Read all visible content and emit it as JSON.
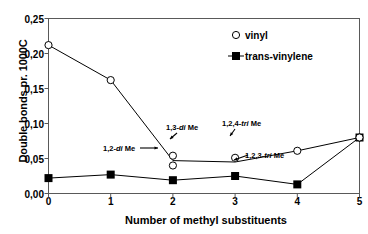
{
  "chart_data": {
    "type": "line",
    "title": "",
    "xlabel": "Number of methyl substituents",
    "ylabel": "Double bonds pr. 1000C",
    "xlim": [
      0,
      5
    ],
    "ylim": [
      0.0,
      0.25
    ],
    "grid": false,
    "legend_position": "top-right",
    "x_ticks": [
      "0",
      "1",
      "2",
      "3",
      "4",
      "5"
    ],
    "y_ticks": [
      "0,00",
      "0,05",
      "0,10",
      "0,15",
      "0,20",
      "0,25"
    ],
    "decimal_separator": ",",
    "series": [
      {
        "name": "vinyl",
        "marker": "open-circle",
        "x": [
          0,
          1,
          2,
          2,
          3,
          4,
          5
        ],
        "values": [
          0.212,
          0.162,
          0.054,
          0.04,
          0.051,
          0.061,
          0.08
        ],
        "line_x": [
          0,
          1,
          2,
          3,
          4,
          5
        ],
        "line_values": [
          0.212,
          0.162,
          0.047,
          0.045,
          0.061,
          0.08
        ]
      },
      {
        "name": "trans-vinylene",
        "marker": "filled-square",
        "x": [
          0,
          1,
          2,
          3,
          4,
          5
        ],
        "values": [
          0.022,
          0.027,
          0.019,
          0.025,
          0.013,
          0.08
        ]
      }
    ],
    "annotations": [
      {
        "id": "a13dime",
        "label_pre": "1,3-",
        "label_it": "di",
        "label_post": " Me",
        "x": 2,
        "y": 0.054
      },
      {
        "id": "a12dime",
        "label_pre": "1,2-",
        "label_it": "di",
        "label_post": " Me",
        "x": 2,
        "y": 0.04
      },
      {
        "id": "a124trime",
        "label_pre": "1,2,4-",
        "label_it": "tri",
        "label_post": " Me",
        "x": 3,
        "y": 0.051
      },
      {
        "id": "a123trime",
        "label_pre": "1,2,3-",
        "label_it": "tri",
        "label_post": " Me",
        "x": 3,
        "y": 0.025
      }
    ],
    "colors": {
      "line": "#000000",
      "frame": "#595959",
      "text": "#000000",
      "background": "#ffffff"
    }
  },
  "axes": {
    "y_title": "Double bonds pr. 1000C",
    "x_title": "Number of methyl substituents",
    "y_tick_labels": [
      "0,25",
      "0,20",
      "0,15",
      "0,10",
      "0,05",
      "0,00"
    ],
    "x_tick_labels": [
      "0",
      "1",
      "2",
      "3",
      "4",
      "5"
    ]
  },
  "legend": {
    "items": [
      {
        "label": "vinyl",
        "marker": "open-circle"
      },
      {
        "label": "trans-vinylene",
        "marker": "filled-square"
      }
    ]
  },
  "annotation_labels": {
    "a13dime_pre": "1,3-",
    "a13dime_it": "di",
    "a13dime_post": " Me",
    "a12dime_pre": "1,2-",
    "a12dime_it": "di",
    "a12dime_post": " Me",
    "a124trime_pre": "1,2,4-",
    "a124trime_it": "tri",
    "a124trime_post": " Me",
    "a123trime_pre": "1,2,3-",
    "a123trime_it": "tri",
    "a123trime_post": " Me"
  }
}
